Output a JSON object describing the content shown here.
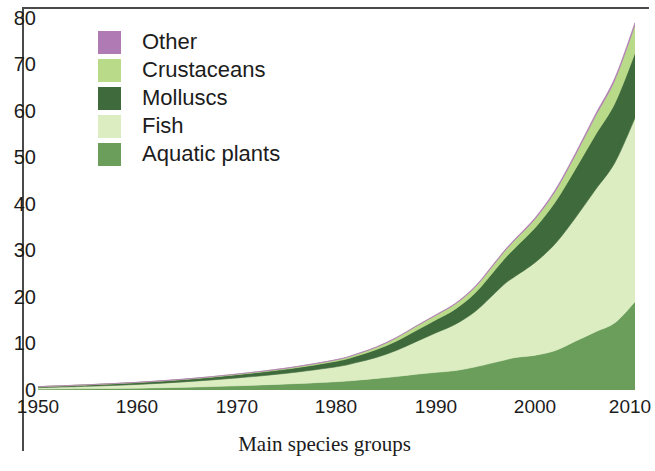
{
  "caption": "Main species groups",
  "axes": {
    "y_ticks": [
      "80",
      "70",
      "60",
      "50",
      "40",
      "30",
      "20",
      "10",
      "0"
    ],
    "x_ticks": [
      "1950",
      "1960",
      "1970",
      "1980",
      "1990",
      "2000",
      "2010"
    ]
  },
  "legend": {
    "items": [
      {
        "label": "Other",
        "color": "#b07ab5",
        "swatch_name": "legend-swatch-other"
      },
      {
        "label": "Crustaceans",
        "color": "#b8da89",
        "swatch_name": "legend-swatch-crustaceans"
      },
      {
        "label": "Molluscs",
        "color": "#3f6a3b",
        "swatch_name": "legend-swatch-molluscs"
      },
      {
        "label": "Fish",
        "color": "#dcedc2",
        "swatch_name": "legend-swatch-fish"
      },
      {
        "label": "Aquatic plants",
        "color": "#6b9d5b",
        "swatch_name": "legend-swatch-aquatic-plants"
      }
    ]
  },
  "chart_data": {
    "type": "area",
    "title": "",
    "subtitle": "",
    "xlabel": "Main species groups",
    "ylabel": "",
    "xlim": [
      1950,
      2010
    ],
    "ylim": [
      0,
      80
    ],
    "grid": false,
    "legend_position": "top-left",
    "stacked": true,
    "stack_order_bottom_to_top": [
      "Aquatic plants",
      "Fish",
      "Molluscs",
      "Crustaceans",
      "Other"
    ],
    "x": [
      1950,
      1955,
      1960,
      1965,
      1970,
      1975,
      1980,
      1982,
      1984,
      1986,
      1988,
      1990,
      1992,
      1994,
      1996,
      1997,
      1998,
      2000,
      2002,
      2004,
      2006,
      2008,
      2010
    ],
    "series": [
      {
        "name": "Aquatic plants",
        "color": "#6b9d5b",
        "values": [
          0.2,
          0.3,
          0.4,
          0.6,
          0.9,
          1.3,
          1.8,
          2.1,
          2.5,
          2.9,
          3.4,
          3.8,
          4.2,
          5.0,
          6.0,
          6.5,
          7.0,
          7.5,
          8.5,
          10.5,
          12.5,
          14.5,
          19.0
        ]
      },
      {
        "name": "Fish",
        "color": "#dcedc2",
        "values": [
          0.3,
          0.5,
          0.8,
          1.2,
          1.7,
          2.3,
          3.2,
          3.8,
          4.5,
          5.6,
          7.0,
          8.5,
          10.0,
          12.0,
          15.0,
          16.5,
          17.5,
          20.0,
          23.0,
          26.5,
          30.5,
          34.5,
          39.5
        ]
      },
      {
        "name": "Molluscs",
        "color": "#3f6a3b",
        "values": [
          0.2,
          0.3,
          0.4,
          0.5,
          0.7,
          0.9,
          1.2,
          1.4,
          1.7,
          2.0,
          2.4,
          2.8,
          3.3,
          4.0,
          5.0,
          5.5,
          6.2,
          7.5,
          9.0,
          10.5,
          11.8,
          12.8,
          14.0
        ]
      },
      {
        "name": "Crustaceans",
        "color": "#b8da89",
        "values": [
          0.02,
          0.03,
          0.05,
          0.08,
          0.12,
          0.2,
          0.3,
          0.4,
          0.5,
          0.7,
          0.9,
          1.0,
          1.1,
          1.3,
          1.5,
          1.6,
          1.7,
          1.9,
          2.3,
          3.0,
          4.0,
          5.0,
          6.0
        ]
      },
      {
        "name": "Other",
        "color": "#b07ab5",
        "values": [
          0.01,
          0.01,
          0.01,
          0.02,
          0.02,
          0.03,
          0.04,
          0.05,
          0.06,
          0.07,
          0.08,
          0.1,
          0.12,
          0.15,
          0.18,
          0.2,
          0.22,
          0.25,
          0.3,
          0.35,
          0.4,
          0.45,
          0.5
        ]
      }
    ],
    "totals": [
      0.73,
      1.14,
      1.66,
      2.4,
      3.44,
      4.73,
      6.54,
      7.75,
      9.26,
      11.27,
      13.78,
      16.2,
      18.72,
      22.45,
      27.68,
      30.3,
      32.62,
      37.15,
      43.1,
      50.85,
      59.2,
      67.25,
      79.0
    ]
  }
}
